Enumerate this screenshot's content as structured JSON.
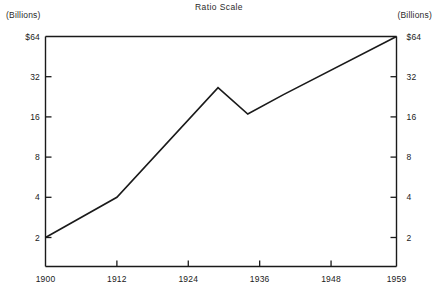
{
  "chart_data": {
    "type": "line",
    "title": "Ratio Scale",
    "xlabel": "",
    "ylabel": "",
    "left_axis_unit": "(Billions)",
    "right_axis_unit": "(Billions)",
    "scale": "log",
    "grid": false,
    "legend": "none",
    "xlim": [
      1900,
      1959
    ],
    "ylim": [
      2,
      64
    ],
    "xticks": [
      1900,
      1912,
      1924,
      1936,
      1948,
      1959
    ],
    "xtick_labels": [
      "1900",
      "1912",
      "1924",
      "1936",
      "1948",
      "1959"
    ],
    "yticks": [
      2,
      4,
      8,
      16,
      32,
      64
    ],
    "ytick_labels_left": [
      "2",
      "4",
      "8",
      "16",
      "32",
      "$64"
    ],
    "ytick_labels_right": [
      "2",
      "4",
      "8",
      "16",
      "32",
      "$64"
    ],
    "series": [
      {
        "name": "value",
        "x": [
          1900,
          1912,
          1929,
          1934,
          1940,
          1959
        ],
        "values": [
          2.0,
          4.0,
          26.5,
          16.8,
          23.5,
          64.0
        ]
      }
    ],
    "line_color": "#1a1a1a",
    "axis_color": "#1a1a1a"
  }
}
